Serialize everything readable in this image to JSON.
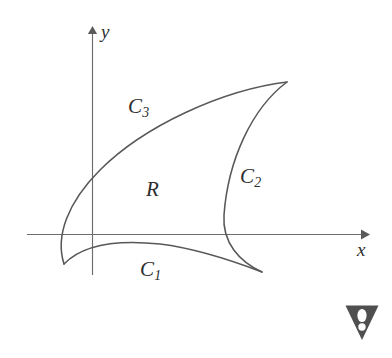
{
  "figure": {
    "background_color": "#ffffff",
    "curve_color": "#585858",
    "axis_color": "#6d6d6d",
    "label_color": "#2e2e2e",
    "width": 392,
    "height": 358
  },
  "axes": {
    "x_label": "x",
    "y_label": "y",
    "x_axis_y_position": 234,
    "y_axis_x_position": 92,
    "x_axis_start": 27,
    "x_axis_end": 367,
    "y_axis_top": 28,
    "y_axis_bottom": 275,
    "arrowheads": [
      "x-axis-right",
      "y-axis-up"
    ]
  },
  "labels": {
    "region": "R",
    "curve1_base": "C",
    "curve1_sub": "1",
    "curve2_base": "C",
    "curve2_sub": "2",
    "curve3_base": "C",
    "curve3_sub": "3"
  },
  "chart_data": {
    "type": "line",
    "xlabel": "x",
    "ylabel": "y",
    "grid": false,
    "legend": "none",
    "annotations": [
      {
        "text": "R",
        "x": 152,
        "y": 192,
        "role": "region-interior"
      },
      {
        "text": "C1",
        "x": 148,
        "y": 272,
        "role": "curve-label"
      },
      {
        "text": "C2",
        "x": 248,
        "y": 178,
        "role": "curve-label"
      },
      {
        "text": "C3",
        "x": 138,
        "y": 110,
        "role": "curve-label"
      }
    ],
    "vertices": [
      {
        "name": "left-cusp",
        "x": 64,
        "y": 264
      },
      {
        "name": "top-right-cusp",
        "x": 287,
        "y": 82
      },
      {
        "name": "bottom-right-cusp",
        "x": 262,
        "y": 272
      }
    ],
    "series": [
      {
        "name": "C1",
        "description": "lower boundary arc from left cusp to bottom-right cusp",
        "path": "M 64 264 C 84 243 122 240 160 244 C 200 249 236 262 262 272"
      },
      {
        "name": "C2",
        "description": "right boundary arc from top-right cusp bulging left to bottom-right cusp",
        "path": "M 287 82 C 252 108 228 160 224 215 C 222 243 240 262 262 272"
      },
      {
        "name": "C3",
        "description": "upper boundary arc from left cusp rising to top-right cusp",
        "path": "M 64 264 C 55 236 68 202 100 170 C 144 126 222 90 287 82"
      }
    ],
    "x": [
      64,
      100,
      160,
      224,
      262,
      287
    ],
    "y": [
      264,
      170,
      244,
      215,
      272,
      82
    ]
  },
  "icons": {
    "warning_badge": "warning-triangle-exclamation-icon"
  }
}
